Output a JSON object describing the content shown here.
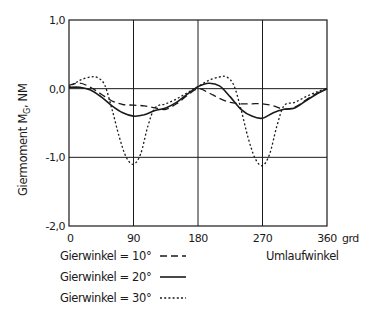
{
  "chart_data": {
    "type": "line",
    "title": "",
    "xlabel": "Umlaufwinkel",
    "x_unit": "grd",
    "ylabel": "Giermoment M",
    "ylabel_subscript": "G",
    "ylabel_unit": ", NM",
    "xlim": [
      0,
      360
    ],
    "ylim": [
      -2.0,
      1.0
    ],
    "x_ticks": [
      0,
      90,
      180,
      270,
      360
    ],
    "x_tick_labels": [
      "0",
      "90",
      "180",
      "270",
      "360"
    ],
    "y_ticks": [
      1.0,
      0.0,
      -1.0,
      -2.0
    ],
    "y_tick_labels": [
      "1,0",
      "0,0",
      "-1,0",
      "-2,0"
    ],
    "grid": {
      "vertical": [
        90,
        180,
        270
      ],
      "horizontal": [
        0.0,
        -1.0
      ]
    },
    "legend_position": "bottom-left",
    "series": [
      {
        "name": "Gierwinkel = 10°",
        "style": "dashed",
        "x": [
          0,
          15,
          30,
          45,
          60,
          75,
          90,
          105,
          120,
          135,
          150,
          165,
          180,
          195,
          210,
          225,
          240,
          255,
          270,
          285,
          300,
          315,
          330,
          345,
          360
        ],
        "values": [
          0.05,
          0.08,
          0.02,
          -0.08,
          -0.18,
          -0.23,
          -0.24,
          -0.25,
          -0.28,
          -0.3,
          -0.22,
          -0.1,
          0.0,
          -0.06,
          -0.14,
          -0.2,
          -0.22,
          -0.22,
          -0.22,
          -0.25,
          -0.3,
          -0.27,
          -0.17,
          -0.07,
          0.0
        ]
      },
      {
        "name": "Gierwinkel = 20°",
        "style": "solid",
        "x": [
          0,
          15,
          30,
          45,
          60,
          75,
          90,
          105,
          120,
          135,
          150,
          165,
          180,
          195,
          210,
          225,
          240,
          255,
          270,
          285,
          300,
          315,
          330,
          345,
          360
        ],
        "values": [
          0.02,
          0.02,
          -0.02,
          -0.12,
          -0.25,
          -0.35,
          -0.4,
          -0.38,
          -0.32,
          -0.28,
          -0.2,
          -0.08,
          0.03,
          0.08,
          0.04,
          -0.12,
          -0.3,
          -0.4,
          -0.43,
          -0.35,
          -0.3,
          -0.28,
          -0.18,
          -0.08,
          0.0
        ]
      },
      {
        "name": "Gierwinkel = 30°",
        "style": "dotted",
        "x": [
          0,
          15,
          30,
          40,
          50,
          60,
          70,
          80,
          90,
          100,
          110,
          120,
          135,
          150,
          165,
          180,
          195,
          210,
          220,
          230,
          240,
          250,
          260,
          270,
          280,
          290,
          300,
          315,
          330,
          345,
          360
        ],
        "values": [
          0.02,
          0.12,
          0.17,
          0.16,
          0.05,
          -0.3,
          -0.7,
          -1.0,
          -1.1,
          -0.95,
          -0.55,
          -0.28,
          -0.22,
          -0.15,
          -0.06,
          0.03,
          0.12,
          0.17,
          0.17,
          0.05,
          -0.3,
          -0.72,
          -1.02,
          -1.12,
          -0.95,
          -0.55,
          -0.25,
          -0.2,
          -0.12,
          -0.05,
          0.0
        ]
      }
    ]
  },
  "legend": {
    "items": [
      {
        "label": "Gierwinkel = 10°",
        "style": "dashed"
      },
      {
        "label": "Gierwinkel = 20°",
        "style": "solid"
      },
      {
        "label": "Gierwinkel = 30°",
        "style": "dotted"
      }
    ]
  },
  "colors": {
    "line": "#1a1a1a",
    "background": "#ffffff"
  }
}
